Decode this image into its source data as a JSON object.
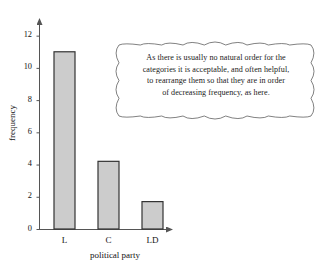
{
  "figure": {
    "background": "#ffffff",
    "bar_fill": "#cccccc",
    "bar_stroke": "#333333",
    "axis_color": "#555555",
    "text_color": "#141414"
  },
  "annotation": {
    "type": "cloud-callout",
    "lines": [
      "As there is usually no natural order for the",
      "categories it is acceptable, and often helpful,",
      "to rearrange them so that they are in order",
      "of decreasing frequency, as here."
    ]
  },
  "chart_data": {
    "type": "bar",
    "title": "",
    "xlabel": "political party",
    "ylabel": "frequency",
    "categories": [
      "L",
      "C",
      "LD"
    ],
    "values": [
      11.0,
      4.2,
      1.7
    ],
    "ylim": [
      0,
      12.6
    ],
    "yticks": [
      0,
      2,
      4,
      6,
      8,
      10,
      12
    ],
    "ytick_labels": [
      "0",
      "2",
      "4",
      "6",
      "8",
      "10",
      "12"
    ],
    "grid": false,
    "legend": null,
    "axis_arrows": true
  }
}
